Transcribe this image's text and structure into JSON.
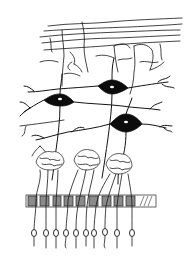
{
  "figure": {
    "type": "line-drawing illustration",
    "colors": {
      "ink": "#141414",
      "background": "#ffffff",
      "band_fill": "#8a8a8a"
    },
    "layers": [
      {
        "name": "fiber-layer",
        "description": "horizontal branching fibers at top"
      },
      {
        "name": "mitral-cell-layer",
        "cell_count": 3
      },
      {
        "name": "glomerular-layer",
        "glomerulus_count": 3
      },
      {
        "name": "cribriform-band",
        "description": "hatched horizontal band"
      },
      {
        "name": "receptor-neuron-layer",
        "cell_count": 10
      }
    ],
    "text_labels": []
  }
}
